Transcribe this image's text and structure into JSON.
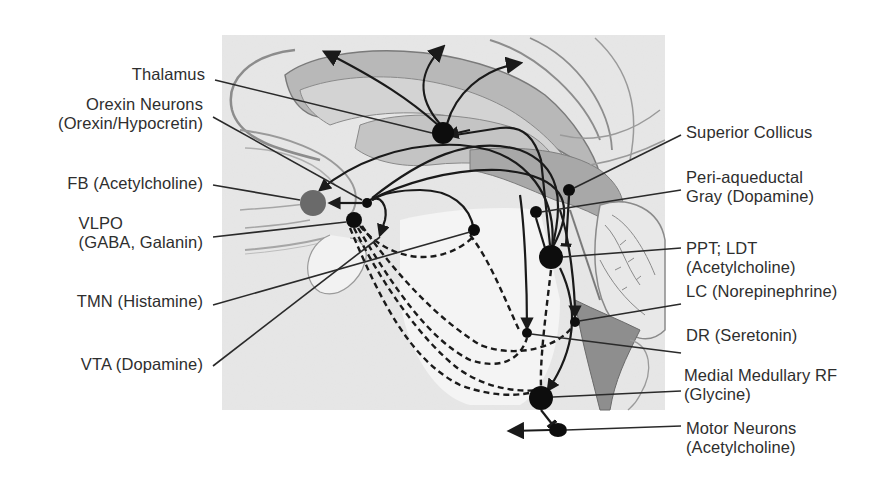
{
  "figure": {
    "panel": {
      "x": 222,
      "y": 35,
      "width": 443,
      "height": 375,
      "background": "#ececec"
    },
    "colors": {
      "ink": "#1a1a1a",
      "node": "#0d0d0d",
      "fb_node": "#6a6a6a",
      "tissue_dark": "#9a9a9a",
      "tissue_mid": "#bdbdbd",
      "tissue_light": "#d9d9d9",
      "label_text": "#2e2e2e"
    }
  },
  "labels_left": [
    {
      "id": "thalamus",
      "lines": [
        "Thalamus"
      ],
      "x": 205,
      "y": 65,
      "line_from": [
        215,
        80
      ],
      "line_to": [
        432,
        133
      ]
    },
    {
      "id": "orexin",
      "lines": [
        "Orexin Neurons",
        "(Orexin/Hypocretin)"
      ],
      "x": 203,
      "y": 95,
      "line_from": [
        213,
        117
      ],
      "line_to": [
        362,
        200
      ]
    },
    {
      "id": "fb",
      "lines": [
        "FB (Acetylcholine)"
      ],
      "x": 203,
      "y": 174,
      "line_from": [
        213,
        185
      ],
      "line_to": [
        300,
        200
      ]
    },
    {
      "id": "vlpo",
      "lines": [
        "VLPO",
        "(GABA, Galanin)"
      ],
      "x": 203,
      "y": 214,
      "line_from": [
        213,
        237
      ],
      "line_to": [
        346,
        222
      ]
    },
    {
      "id": "tmn",
      "lines": [
        "TMN (Histamine)"
      ],
      "x": 203,
      "y": 292,
      "line_from": [
        213,
        305
      ],
      "line_to": [
        470,
        232
      ]
    },
    {
      "id": "vta",
      "lines": [
        "VTA (Dopamine)"
      ],
      "x": 203,
      "y": 355,
      "line_from": [
        213,
        366
      ],
      "line_to": [
        380,
        237
      ]
    }
  ],
  "labels_right": [
    {
      "id": "superior-colliculus",
      "lines": [
        "Superior Collicus"
      ],
      "x": 686,
      "y": 123,
      "line_from": [
        681,
        135
      ],
      "line_to": [
        574,
        188
      ]
    },
    {
      "id": "pag",
      "lines": [
        "Peri-aqueductal",
        "Gray (Dopamine)"
      ],
      "x": 686,
      "y": 168,
      "line_from": [
        681,
        190
      ],
      "line_to": [
        541,
        212
      ]
    },
    {
      "id": "ppt-ldt",
      "lines": [
        "PPT; LDT",
        "(Acetylcholine)"
      ],
      "x": 686,
      "y": 239,
      "line_from": [
        681,
        248
      ],
      "line_to": [
        563,
        257
      ]
    },
    {
      "id": "lc",
      "lines": [
        "LC (Norepinephrine)"
      ],
      "x": 686,
      "y": 282,
      "line_from": [
        681,
        304
      ],
      "line_to": [
        579,
        321
      ]
    },
    {
      "id": "dr",
      "lines": [
        "DR (Seretonin)"
      ],
      "x": 686,
      "y": 326,
      "line_from": [
        681,
        353
      ],
      "line_to": [
        531,
        334
      ]
    },
    {
      "id": "medial-medullary-rf",
      "lines": [
        "Medial Medullary RF",
        "(Glycine)"
      ],
      "x": 684,
      "y": 366,
      "line_from": [
        681,
        391
      ],
      "line_to": [
        553,
        397
      ]
    },
    {
      "id": "motor-neurons",
      "lines": [
        "Motor Neurons",
        "(Acetylcholine)"
      ],
      "x": 686,
      "y": 419,
      "line_from": [
        681,
        426
      ],
      "line_to": [
        566,
        430
      ]
    }
  ],
  "nodes": [
    {
      "id": "thalamus",
      "cx": 443,
      "cy": 133,
      "r": 11,
      "fill": "node"
    },
    {
      "id": "fb",
      "cx": 313,
      "cy": 203,
      "r": 13,
      "fill": "fb_node"
    },
    {
      "id": "orexin",
      "cx": 367,
      "cy": 203,
      "r": 5,
      "fill": "node"
    },
    {
      "id": "vlpo",
      "cx": 354,
      "cy": 220,
      "r": 8,
      "fill": "node"
    },
    {
      "id": "tmn",
      "cx": 474,
      "cy": 230,
      "r": 6,
      "fill": "node"
    },
    {
      "id": "superior-colliculus",
      "cx": 569,
      "cy": 190,
      "r": 6,
      "fill": "node"
    },
    {
      "id": "pag",
      "cx": 536,
      "cy": 212,
      "r": 6,
      "fill": "node"
    },
    {
      "id": "ppt-ldt",
      "cx": 551,
      "cy": 257,
      "r": 12,
      "fill": "node"
    },
    {
      "id": "lc",
      "cx": 575,
      "cy": 322,
      "r": 5,
      "fill": "node"
    },
    {
      "id": "dr",
      "cx": 527,
      "cy": 333,
      "r": 5,
      "fill": "node"
    },
    {
      "id": "medial-medullary-rf",
      "cx": 541,
      "cy": 398,
      "r": 12,
      "fill": "node"
    },
    {
      "id": "motor-neurons",
      "cx": 558,
      "cy": 430,
      "r": 8,
      "fill": "node"
    }
  ],
  "legend_note": "Solid arrows: excitatory projections; dashed lines: inhibitory (VLPO) projections"
}
